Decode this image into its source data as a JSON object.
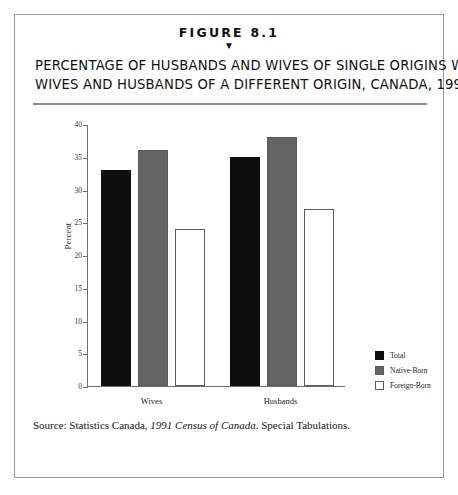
{
  "figure": {
    "number": "FIGURE 8.1",
    "marker_icon": "down-triangle-icon",
    "marker_glyph": "▼",
    "title_line1": "PERCENTAGE OF HUSBANDS AND WIVES OF SINGLE ORIGINS WITH",
    "title_line2": "WIVES AND HUSBANDS OF A DIFFERENT ORIGIN, CANADA, 1991"
  },
  "source": {
    "prefix": "Source: Statistics Canada, ",
    "italic": "1991 Census of Canada",
    "suffix": ". Special Tabulations."
  },
  "chart_data": {
    "type": "bar",
    "title": "PERCENTAGE OF HUSBANDS AND WIVES OF SINGLE ORIGINS WITH WIVES AND HUSBANDS OF A DIFFERENT ORIGIN, CANADA, 1991",
    "xlabel": "",
    "ylabel": "Percent",
    "categories": [
      "Wives",
      "Husbands"
    ],
    "series": [
      {
        "name": "Total",
        "color": "#0d0d0d",
        "values": [
          33,
          35
        ]
      },
      {
        "name": "Native-Born",
        "color": "#636363",
        "values": [
          36,
          38
        ]
      },
      {
        "name": "Foreign-Born",
        "color": "#ffffff",
        "values": [
          24,
          27
        ]
      }
    ],
    "ylim": [
      0,
      40
    ],
    "yticks": [
      0,
      5,
      10,
      15,
      20,
      25,
      30,
      35,
      40
    ],
    "grid": false,
    "legend_position": "right"
  }
}
